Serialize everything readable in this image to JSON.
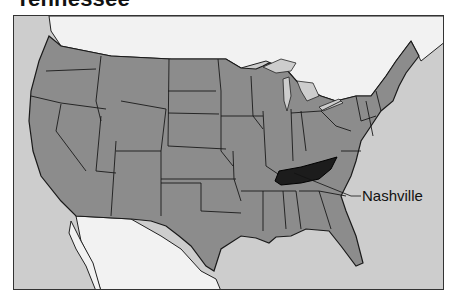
{
  "title": "Tennessee",
  "map": {
    "highlighted_state": "Tennessee",
    "capital_label": "Nashville",
    "colors": {
      "ocean": "#cdcdcd",
      "foreign_land": "#f2f2f2",
      "us_states": "#8c8c8c",
      "highlight": "#1c1c1c",
      "borders": "#1a1a1a"
    }
  }
}
